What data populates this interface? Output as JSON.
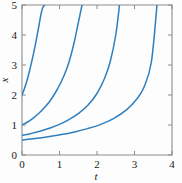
{
  "chart_data": {
    "type": "line",
    "title": "",
    "xlabel": "t",
    "ylabel": "x",
    "xlim": [
      0,
      4
    ],
    "ylim": [
      0,
      5
    ],
    "xticks": [
      0,
      1,
      2,
      3,
      4
    ],
    "yticks": [
      0,
      1,
      2,
      3,
      4,
      5
    ],
    "xtick_labels": [
      "0",
      "1",
      "2",
      "3",
      "4"
    ],
    "ytick_labels": [
      "0",
      "1",
      "2",
      "3",
      "4",
      "5"
    ],
    "grid": false,
    "legend": null,
    "series_color": "#2f7fbf",
    "frame_color": "#8c8c8c",
    "background": "#fdfdfd",
    "series": [
      {
        "name": "curve-1",
        "initial_value": 2.0,
        "exit_t": 0.6,
        "x": [
          0.0,
          0.05,
          0.1,
          0.15,
          0.2,
          0.25,
          0.3,
          0.35,
          0.4,
          0.45,
          0.5,
          0.55,
          0.6
        ],
        "values": [
          2.0,
          2.16,
          2.35,
          2.56,
          2.8,
          3.06,
          3.34,
          3.64,
          3.96,
          4.3,
          4.65,
          4.9,
          5.0
        ]
      },
      {
        "name": "curve-2",
        "initial_value": 1.0,
        "exit_t": 1.6,
        "x": [
          0.0,
          0.15,
          0.3,
          0.45,
          0.6,
          0.75,
          0.9,
          1.05,
          1.2,
          1.3,
          1.4,
          1.5,
          1.6
        ],
        "values": [
          1.0,
          1.1,
          1.23,
          1.39,
          1.58,
          1.81,
          2.1,
          2.45,
          2.9,
          3.3,
          3.8,
          4.4,
          5.0
        ]
      },
      {
        "name": "curve-3",
        "initial_value": 0.65,
        "exit_t": 2.6,
        "x": [
          0.0,
          0.25,
          0.5,
          0.75,
          1.0,
          1.25,
          1.5,
          1.75,
          2.0,
          2.2,
          2.35,
          2.5,
          2.6
        ],
        "values": [
          0.65,
          0.72,
          0.8,
          0.9,
          1.02,
          1.18,
          1.38,
          1.65,
          2.05,
          2.55,
          3.1,
          4.0,
          5.0
        ]
      },
      {
        "name": "curve-4",
        "initial_value": 0.5,
        "exit_t": 3.6,
        "x": [
          0.0,
          0.35,
          0.7,
          1.05,
          1.4,
          1.75,
          2.1,
          2.45,
          2.8,
          3.05,
          3.25,
          3.45,
          3.6
        ],
        "values": [
          0.5,
          0.55,
          0.61,
          0.68,
          0.77,
          0.88,
          1.02,
          1.22,
          1.52,
          1.85,
          2.25,
          3.1,
          5.0
        ]
      }
    ]
  }
}
